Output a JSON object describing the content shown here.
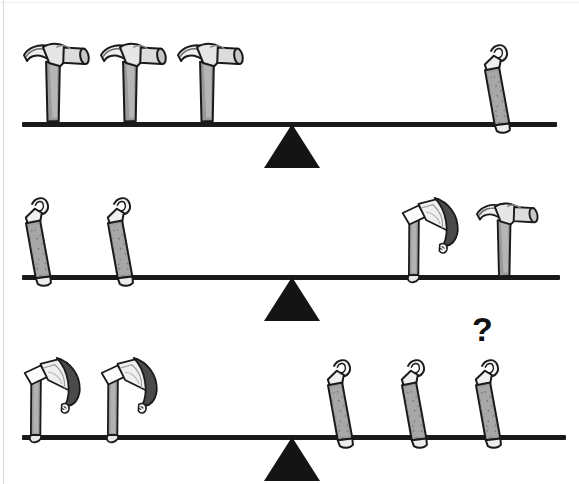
{
  "page": {
    "background_color": "#ffffff",
    "ink_color": "#1a1a1a",
    "width": 579,
    "height": 484
  },
  "annotations": {
    "question_mark": "?"
  },
  "puzzle": {
    "item_names": {
      "hammer": "hammer",
      "nail_file": "nail-file",
      "axe": "axe"
    },
    "rows": [
      {
        "id": "row-1",
        "label": "Balance 1",
        "beam_y": 124,
        "beam_left": 22,
        "beam_right": 557,
        "fulcrum_x": 292,
        "left_side": {
          "item": "hammer",
          "count": 3
        },
        "right_side": {
          "item": "nail_file",
          "count": 1
        },
        "relation": "balanced"
      },
      {
        "id": "row-2",
        "label": "Balance 2",
        "beam_y": 277,
        "beam_left": 22,
        "beam_right": 560,
        "fulcrum_x": 292,
        "left_side": {
          "item": "nail_file",
          "count": 2
        },
        "right_side": {
          "item": "axe",
          "count": 1,
          "item_2": "hammer",
          "count_2": 1
        },
        "relation": "balanced"
      },
      {
        "id": "row-3",
        "label": "Balance 3",
        "beam_y": 437,
        "beam_left": 22,
        "beam_right": 566,
        "fulcrum_x": 292,
        "left_side": {
          "item": "axe",
          "count": 2
        },
        "right_side": {
          "item": "nail_file",
          "count": 3
        },
        "relation": "unknown"
      }
    ]
  },
  "objects": {
    "row1_left": [
      {
        "name": "hammer",
        "x": 30,
        "y": 38,
        "scale": 1.0,
        "rot": -12
      },
      {
        "name": "hammer",
        "x": 107,
        "y": 38,
        "scale": 1.0,
        "rot": -12
      },
      {
        "name": "hammer",
        "x": 184,
        "y": 38,
        "scale": 1.0,
        "rot": -12
      }
    ],
    "row1_right": [
      {
        "name": "nail_file",
        "x": 487,
        "y": 43,
        "scale": 1.0,
        "rot": -28
      }
    ],
    "row2_left": [
      {
        "name": "nail_file",
        "x": 30,
        "y": 196,
        "scale": 1.0,
        "rot": -28
      },
      {
        "name": "nail_file",
        "x": 112,
        "y": 196,
        "scale": 1.0,
        "rot": -28
      }
    ],
    "row2_right": [
      {
        "name": "axe",
        "x": 398,
        "y": 196,
        "scale": 1.0,
        "rot": -12
      },
      {
        "name": "hammer",
        "x": 482,
        "y": 200,
        "scale": 1.0,
        "rot": -12
      }
    ],
    "row3_left": [
      {
        "name": "axe",
        "x": 18,
        "y": 356,
        "scale": 1.0,
        "rot": -12
      },
      {
        "name": "axe",
        "x": 95,
        "y": 356,
        "scale": 1.0,
        "rot": -12
      }
    ],
    "row3_right": [
      {
        "name": "nail_file",
        "x": 330,
        "y": 358,
        "scale": 1.0,
        "rot": -28
      },
      {
        "name": "nail_file",
        "x": 404,
        "y": 358,
        "scale": 1.0,
        "rot": -28
      },
      {
        "name": "nail_file",
        "x": 478,
        "y": 358,
        "scale": 1.0,
        "rot": -28
      }
    ],
    "question_mark_pos": {
      "x": 470,
      "y": 310
    }
  },
  "colors": {
    "ink": "#1a1a1a",
    "fill_light": "#f2f2f2",
    "fill_mid": "#9c9c9c",
    "fill_dark": "#4d4d4d",
    "fill_handle": "#8f8f8f",
    "paper": "#ffffff"
  }
}
